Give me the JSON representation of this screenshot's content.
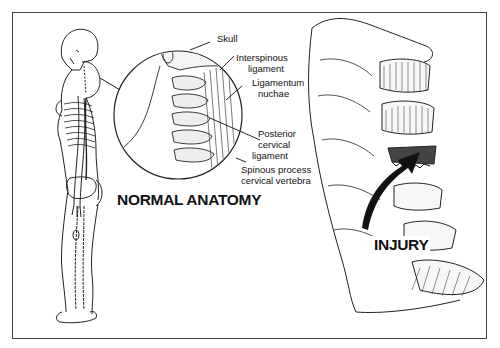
{
  "figure": {
    "title_normal": "NORMAL ANATOMY",
    "title_injury": "INJURY",
    "labels": {
      "skull": "Skull",
      "interspinous_1": "Interspinous",
      "interspinous_2": "ligament",
      "nuchae_1": "Ligamentum",
      "nuchae_2": "nuchae",
      "posterior_1": "Posterior",
      "posterior_2": "cervical",
      "posterior_3": "ligament",
      "spinous_1": "Spinous process",
      "spinous_2": "cervical vertebra"
    },
    "colors": {
      "ink": "#111111",
      "frame": "#444444",
      "background": "#ffffff"
    }
  }
}
